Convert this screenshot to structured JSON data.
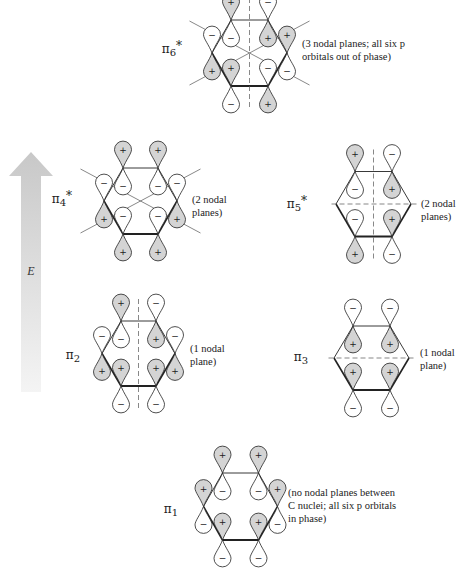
{
  "energy_axis": {
    "label": "E",
    "direction": "up",
    "color_top": "#c8c8c8",
    "color_bottom": "#f4f4f4"
  },
  "colors": {
    "shaded_lobe": "#d4d4d4",
    "line": "#222222"
  },
  "orbitals": [
    {
      "id": "pi6",
      "label_main": "π",
      "label_sub": "6",
      "label_star": "*",
      "note_lines": [
        "(3 nodal planes; all six p",
        "orbitals out of phase)"
      ],
      "nodal_planes": 3,
      "top_signs": [
        "+",
        "-",
        "+",
        "-",
        "+",
        "-"
      ],
      "nodes": [
        "vertical",
        "diag-down",
        "diag-up"
      ]
    },
    {
      "id": "pi4",
      "label_main": "π",
      "label_sub": "4",
      "label_star": "*",
      "note_lines": [
        "(2 nodal",
        "planes)"
      ],
      "nodal_planes": 2,
      "top_signs": [
        "+",
        "+",
        "-",
        "-",
        "-",
        "-"
      ],
      "nodes": [
        "diag-down",
        "diag-up"
      ]
    },
    {
      "id": "pi5",
      "label_main": "π",
      "label_sub": "5",
      "label_star": "*",
      "note_lines": [
        "(2 nodal",
        "planes)"
      ],
      "nodal_planes": 2,
      "top_signs": [
        "+",
        "-",
        "-",
        "+"
      ],
      "nodes": [
        "vertical",
        "horizontal"
      ]
    },
    {
      "id": "pi2",
      "label_main": "π",
      "label_sub": "2",
      "label_star": "",
      "note_lines": [
        "(1 nodal",
        "plane)"
      ],
      "nodal_planes": 1,
      "top_signs": [
        "+",
        "-",
        "-",
        "+",
        "+",
        "-"
      ],
      "nodes": [
        "vertical"
      ]
    },
    {
      "id": "pi3",
      "label_main": "π",
      "label_sub": "3",
      "label_star": "",
      "note_lines": [
        "(1 nodal",
        "plane)"
      ],
      "nodal_planes": 1,
      "top_signs": [
        "-",
        "-",
        "+",
        "+"
      ],
      "nodes": [
        "horizontal"
      ]
    },
    {
      "id": "pi1",
      "label_main": "π",
      "label_sub": "1",
      "label_star": "",
      "note_lines": [
        "(no nodal planes between",
        "C nuclei; all six p orbitals",
        "in phase)"
      ],
      "nodal_planes": 0,
      "top_signs": [
        "+",
        "+",
        "+",
        "+",
        "+",
        "+"
      ],
      "nodes": []
    }
  ]
}
